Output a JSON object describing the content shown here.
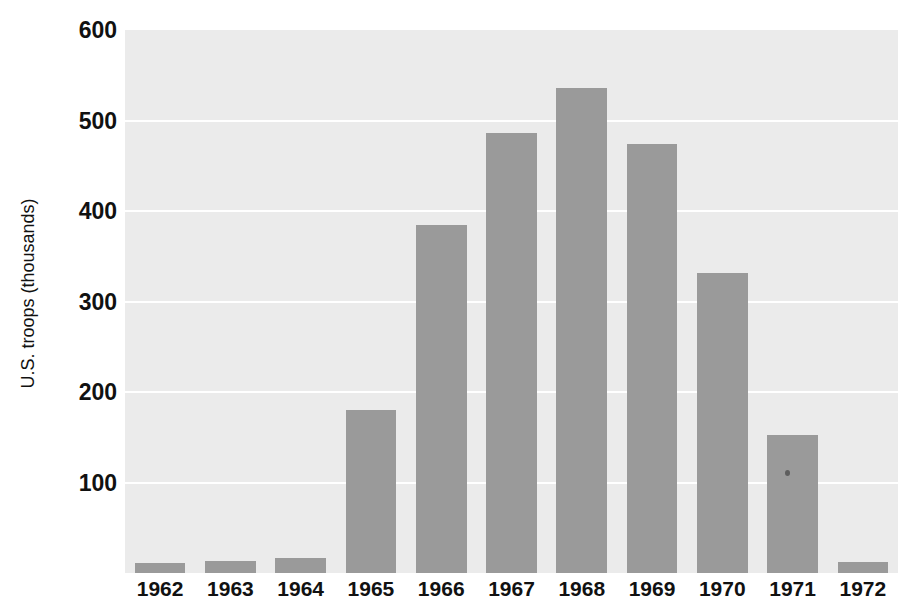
{
  "chart_data": {
    "type": "bar",
    "title": "",
    "xlabel": "",
    "ylabel": "U.S. troops (thousands)",
    "categories": [
      "1962",
      "1963",
      "1964",
      "1965",
      "1966",
      "1967",
      "1968",
      "1969",
      "1970",
      "1971",
      "1972"
    ],
    "values": [
      11,
      13,
      17,
      180,
      385,
      486,
      536,
      474,
      332,
      153,
      12
    ],
    "ylim": [
      0,
      600
    ],
    "yticks": [
      100,
      200,
      300,
      400,
      500,
      600
    ],
    "ytick_labels": [
      "100",
      "200",
      "300",
      "400",
      "500",
      "600"
    ],
    "grid": true,
    "legend": "none",
    "bar_color": "#9a9a9a",
    "plot_background": "#ebebeb",
    "gridline_color": "#ffffff"
  },
  "background_text": {
    "heading": "n All-Out L           Vietnam",
    "lines": [
      "ndy n 1965 and 1966. See Map 27.2.) Once home, Rolling Thunder wid",
      "damage to North Vietnam's ability to wage war. In response, Hanoi in 1965 a",
      "pened the massive military effort, responding to every escalation of U.S. bom",
      "troop joined. The U.S. military commander in Vietnam, General William We",
      "the way forward in the South depended on the numbers the U.S. could",
      "ayer a major buildup of U.S. forces in Vietnam, and a more aggressive policy was dire",
      "on with an escalating air war against the North, but it was to be no more than",
      "ican intervention, but Johnson was concerned about the public reaction and",
      "ticing and saw resources for the Great Society. Also, the president was wary",
      "sed, the war in Vietnam would spread beyond all reason and control.",
      "ather administration officials assured a worried public that the U.S.",
      "part. In reality, the United States was waging a war of attrition, grinding",
      "with superior firepower, and the tunnels and mountains of Vietnam"
    ]
  }
}
